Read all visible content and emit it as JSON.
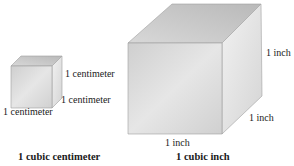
{
  "small_cube": {
    "edge_right_label": "1 centimeter",
    "edge_depth_label": "1 centimeter",
    "edge_bottom_label": "1 centimeter",
    "caption": "1 cubic centimeter"
  },
  "large_cube": {
    "edge_right_label": "1 inch",
    "edge_depth_label": "1 inch",
    "edge_bottom_label": "1 inch",
    "caption": "1 cubic inch"
  },
  "colors": {
    "front_face": "#d6d6d6",
    "top_face": "#c4c4c4",
    "side_face": "#e2e2e2",
    "edge": "#9a9a9a"
  }
}
